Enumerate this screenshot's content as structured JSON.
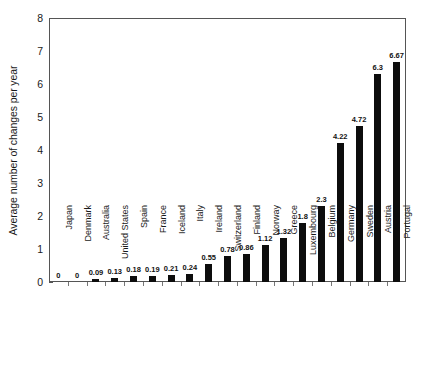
{
  "chart_data": {
    "type": "bar",
    "title": "",
    "xlabel": "",
    "ylabel": "Average number of changes per year",
    "ylim": [
      0,
      8
    ],
    "ytick_values": [
      0,
      1,
      2,
      3,
      4,
      5,
      6,
      7,
      8
    ],
    "ytick_labels": [
      "0",
      "1",
      "2",
      "3",
      "4",
      "5",
      "6",
      "7",
      "8"
    ],
    "yminor_step": 0.5,
    "grid": false,
    "legend": null,
    "bar_color": "#0d0d0d",
    "categories": [
      "Japan",
      "Denmark",
      "Australia",
      "United States",
      "Spain",
      "France",
      "Iceland",
      "Italy",
      "Ireland",
      "Switzerland",
      "Finland",
      "Norway",
      "Greece",
      "Luxembourg",
      "Belgium",
      "Germany",
      "Sweden",
      "Austria",
      "Portugal"
    ],
    "values": [
      0,
      0,
      0.09,
      0.13,
      0.18,
      0.19,
      0.21,
      0.24,
      0.55,
      0.78,
      0.86,
      1.12,
      1.32,
      1.8,
      2.3,
      4.22,
      4.72,
      6.3,
      6.67
    ],
    "value_labels": [
      "0",
      "0",
      "0.09",
      "0.13",
      "0.18",
      "0.19",
      "0.21",
      "0.24",
      "0.55",
      "0.78",
      "0.86",
      "1.12",
      "1.32",
      "1.8",
      "2.3",
      "4.22",
      "4.72",
      "6.3",
      "6.67"
    ]
  }
}
